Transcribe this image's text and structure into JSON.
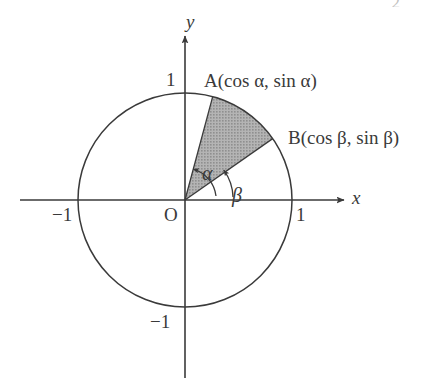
{
  "figure": {
    "kind": "unit-circle-diagram",
    "corner_mark": "2",
    "axes": {
      "x_label": "x",
      "y_label": "y",
      "origin_label": "O",
      "x_ticks": [
        {
          "label": "−1",
          "value": -1
        },
        {
          "label": "1",
          "value": 1
        }
      ],
      "y_ticks": [
        {
          "label": "1",
          "value": 1
        },
        {
          "label": "−1",
          "value": -1
        }
      ]
    },
    "circle": {
      "radius_label": "1",
      "center": [
        0,
        0
      ]
    },
    "points": [
      {
        "name": "A",
        "label": "A(cos α, sin α)",
        "angle_deg": 75
      },
      {
        "name": "B",
        "label": "B(cos β, sin β)",
        "angle_deg": 35
      }
    ],
    "angles": [
      {
        "name": "alpha",
        "label": "α",
        "measured_to": "A"
      },
      {
        "name": "beta",
        "label": "β",
        "measured_to": "B"
      }
    ],
    "shaded_sector": {
      "from_point": "B",
      "to_point": "A",
      "fill": "#a9a9a9"
    },
    "colors": {
      "stroke": "#3a3a3a",
      "shade": "#a9a9a9",
      "background": "#ffffff"
    }
  }
}
